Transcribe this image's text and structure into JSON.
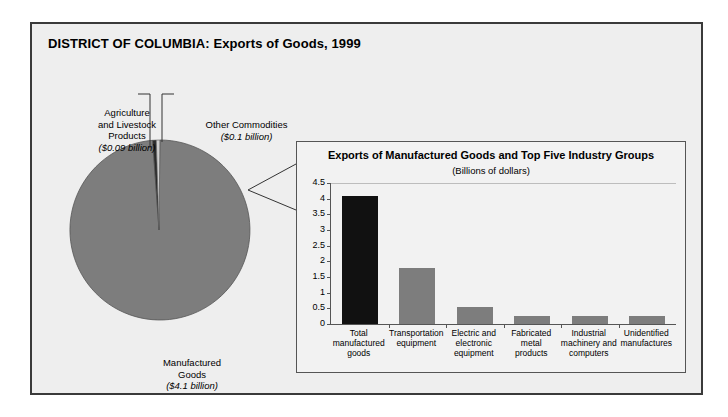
{
  "figure": {
    "title": "DISTRICT OF COLUMBIA: Exports of Goods, 1999"
  },
  "pie": {
    "labels": {
      "agriculture": {
        "name_line1": "Agriculture",
        "name_line2": "and Livestock",
        "name_line3": "Products",
        "amount": "($0.09 billion)"
      },
      "other": {
        "name_line1": "Other Commodities",
        "amount": "($0.1 billion)"
      },
      "manufactured": {
        "name_line1": "Manufactured",
        "name_line2": "Goods",
        "amount": "($4.1 billion)"
      }
    }
  },
  "bar_panel": {
    "title": "Exports of Manufactured Goods and Top Five Industry Groups",
    "subtitle": "(Billions of dollars)"
  },
  "chart_data": [
    {
      "type": "pie",
      "title": "DISTRICT OF COLUMBIA: Exports of Goods, 1999",
      "unit": "billions of dollars",
      "categories": [
        "Manufactured Goods",
        "Agriculture and Livestock Products",
        "Other Commodities"
      ],
      "values": [
        4.1,
        0.09,
        0.1
      ],
      "labels": [
        "($4.1 billion)",
        "($0.09 billion)",
        "($0.1 billion)"
      ],
      "colors": [
        "#7d7d7d",
        "#2b2b2b",
        "#cfcfcf"
      ],
      "legend": "none"
    },
    {
      "type": "bar",
      "title": "Exports of Manufactured Goods and Top Five Industry Groups",
      "subtitle": "(Billions of dollars)",
      "xlabel": "",
      "ylabel": "",
      "ylim": [
        0,
        4.5
      ],
      "yticks": [
        "0",
        "0.5",
        "1",
        "1.5",
        "2",
        "2.5",
        "3",
        "3.5",
        "4",
        "4.5"
      ],
      "ytick_values": [
        0,
        0.5,
        1,
        1.5,
        2,
        2.5,
        3,
        3.5,
        4,
        4.5
      ],
      "grid": false,
      "legend": "none",
      "categories": [
        "Total manufactured goods",
        "Transportation equipment",
        "Electric and electronic equipment",
        "Fabricated metal products",
        "Industrial machinery and computers",
        "Unidentified manufactures"
      ],
      "category_lines": [
        [
          "Total",
          "manufactured",
          "goods"
        ],
        [
          "Transportation",
          "equipment"
        ],
        [
          "Electric and",
          "electronic",
          "equipment"
        ],
        [
          "Fabricated",
          "metal",
          "products"
        ],
        [
          "Industrial",
          "machinery and",
          "computers"
        ],
        [
          "Unidentified",
          "manufactures"
        ]
      ],
      "values": [
        4.1,
        1.8,
        0.55,
        0.27,
        0.25,
        0.25
      ],
      "bar_colors": [
        "#111111",
        "#7d7d7d",
        "#7d7d7d",
        "#7d7d7d",
        "#7d7d7d",
        "#7d7d7d"
      ]
    }
  ]
}
